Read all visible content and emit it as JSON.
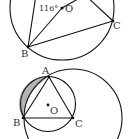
{
  "figures": [
    {
      "id": "figure-top",
      "points": {
        "B": "B",
        "C": "C",
        "O": "O"
      },
      "angle_label": "116°",
      "colors": {
        "stroke": "#111111",
        "text": "#333333"
      }
    },
    {
      "id": "figure-bottom",
      "points": {
        "A": "A",
        "B": "B",
        "C": "C",
        "O": "O"
      },
      "colors": {
        "stroke": "#111111",
        "shade": "#b3b3b3",
        "text": "#333333"
      }
    }
  ]
}
